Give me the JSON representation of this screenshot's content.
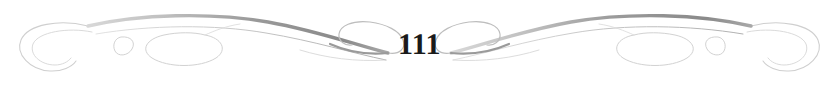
{
  "page": {
    "width": 839,
    "height": 88,
    "background_color": "#ffffff"
  },
  "footer": {
    "page_number": "111",
    "page_number_color": "#1a1a1a",
    "ornament_name": "double-scroll-flourish-divider",
    "ornament_description": "Symmetrical calligraphic scrollwork flourish flanking the page number, with terminal C-curls at both outer ends, large open ovals, small leaf teardrops, and inward-facing spirals meeting at the centered page number.",
    "ornament_colors": {
      "stroke_dark": "#8a8a8a",
      "stroke_mid": "#b4b4b4",
      "stroke_light": "#cfcfcf",
      "stroke_hairline": "#dcdcdc"
    }
  }
}
